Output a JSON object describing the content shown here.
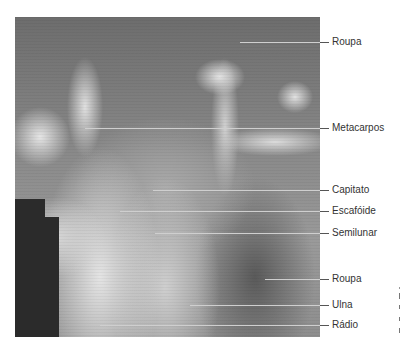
{
  "figure": {
    "type": "radiograph",
    "labels": [
      {
        "id": "roupa-top",
        "text": "Roupa",
        "y": 42,
        "line_start_x": 240
      },
      {
        "id": "metacarpos",
        "text": "Metacarpos",
        "y": 128,
        "line_start_x": 85
      },
      {
        "id": "capitato",
        "text": "Capitato",
        "y": 190,
        "line_start_x": 153
      },
      {
        "id": "escafoide",
        "text": "Escafóide",
        "y": 211,
        "line_start_x": 120
      },
      {
        "id": "semilunar",
        "text": "Semilunar",
        "y": 233,
        "line_start_x": 155
      },
      {
        "id": "roupa-bottom",
        "text": "Roupa",
        "y": 279,
        "line_start_x": 265
      },
      {
        "id": "ulna",
        "text": "Ulna",
        "y": 305,
        "line_start_x": 190
      },
      {
        "id": "radio",
        "text": "Rádio",
        "y": 325,
        "line_start_x": 100
      }
    ]
  }
}
